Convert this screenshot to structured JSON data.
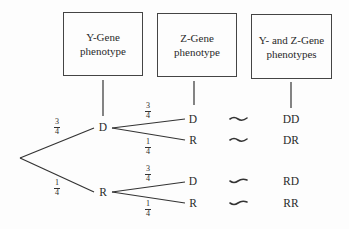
{
  "headers": [
    {
      "line1": "Y-Gene",
      "line2": "phenotype"
    },
    {
      "line1": "Z-Gene",
      "line2": "phenotype"
    },
    {
      "line1": "Y- and Z-Gene",
      "line2": "phenotypes"
    }
  ],
  "tree": {
    "level1": [
      {
        "label": "D",
        "prob_num": "3",
        "prob_den": "4"
      },
      {
        "label": "R",
        "prob_num": "1",
        "prob_den": "4"
      }
    ],
    "level2": [
      {
        "label": "D",
        "prob_num": "3",
        "prob_den": "4",
        "result": "DD"
      },
      {
        "label": "R",
        "prob_num": "1",
        "prob_den": "4",
        "result": "DR"
      },
      {
        "label": "D",
        "prob_num": "3",
        "prob_den": "4",
        "result": "RD"
      },
      {
        "label": "R",
        "prob_num": "1",
        "prob_den": "4",
        "result": "RR"
      }
    ]
  },
  "connector_symbol": "tilde-icon",
  "colors": {
    "line": "#333333",
    "text": "#2a2a2a",
    "background": "#fdfdfd"
  }
}
